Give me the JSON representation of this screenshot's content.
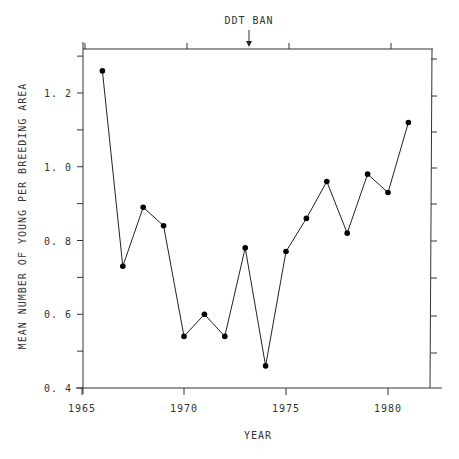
{
  "chart_data": {
    "type": "line",
    "title": "",
    "xlabel": "YEAR",
    "ylabel": "MEAN NUMBER OF YOUNG PER BREEDING AREA",
    "x": [
      1966,
      1967,
      1968,
      1969,
      1970,
      1971,
      1972,
      1973,
      1974,
      1975,
      1976,
      1977,
      1978,
      1979,
      1980,
      1981
    ],
    "series": [
      {
        "name": "Mean young per breeding area",
        "values": [
          1.26,
          0.73,
          0.89,
          0.84,
          0.54,
          0.6,
          0.54,
          0.78,
          0.46,
          0.77,
          0.86,
          0.96,
          0.82,
          0.98,
          0.93,
          1.12
        ]
      }
    ],
    "xlim": [
      1965,
      1982
    ],
    "ylim": [
      0.4,
      1.32
    ],
    "x_ticks": [
      "1965",
      "1970",
      "1975",
      "1980"
    ],
    "y_ticks": [
      "0. 4",
      "0. 6",
      "0. 8",
      "1. 0",
      "1. 2"
    ],
    "grid": false,
    "legend": "none",
    "annotations": [
      {
        "text": "DDT BAN",
        "x": 1973,
        "type": "arrow-down-to-top-axis"
      }
    ],
    "markers": "filled-circle"
  }
}
